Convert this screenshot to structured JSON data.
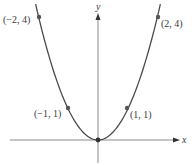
{
  "chart_data": {
    "type": "line",
    "title": "",
    "function": "y = x^2",
    "xlabel": "x",
    "ylabel": "y",
    "xlim": [
      -2.1,
      2.1
    ],
    "ylim": [
      0,
      4.1
    ],
    "grid": false,
    "legend": null,
    "series": [
      {
        "name": "y = x^2",
        "x": [
          -2,
          -1.5,
          -1,
          -0.5,
          0,
          0.5,
          1,
          1.5,
          2
        ],
        "values": [
          4,
          2.25,
          1,
          0.25,
          0,
          0.25,
          1,
          2.25,
          4
        ]
      }
    ],
    "points": [
      {
        "x": -2,
        "y": 4,
        "label": "(−2, 4)"
      },
      {
        "x": -1,
        "y": 1,
        "label": "(−1, 1)"
      },
      {
        "x": 0,
        "y": 0,
        "label": ""
      },
      {
        "x": 1,
        "y": 1,
        "label": "(1, 1)"
      },
      {
        "x": 2,
        "y": 4,
        "label": "(2, 4)"
      }
    ]
  },
  "labels": {
    "x_axis": "x",
    "y_axis": "y",
    "p_neg2": "(−2, 4)",
    "p_neg1": "(−1, 1)",
    "p_pos1": "(1, 1)",
    "p_pos2": "(2, 4)"
  },
  "colors": {
    "curve": "#4a4a4a",
    "axis": "#8a8a8a",
    "text": "#3a3a3a"
  }
}
